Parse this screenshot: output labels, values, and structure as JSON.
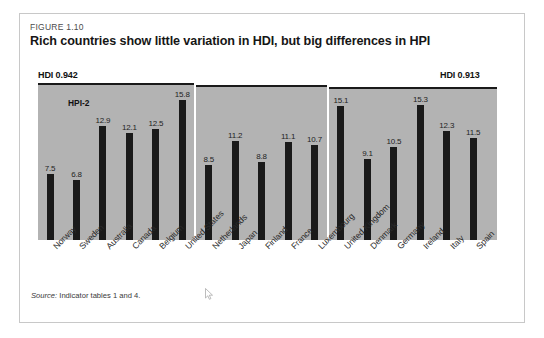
{
  "figure": {
    "number": "FIGURE 1.10",
    "title": "Rich countries show little variation in HDI, but big differences in HPI",
    "source_prefix": "Source:",
    "source_rest": " Indicator tables 1 and 4."
  },
  "annotations": {
    "hdi_left": "HDI 0.942",
    "hdi_right": "HDI 0.913",
    "series_label": "HPI-2"
  },
  "colors": {
    "plot_background": "#b3b3b3",
    "bar": "#1a1a1a",
    "frame": "#c8c8c8",
    "page": "#ffffff",
    "title_text": "#161616"
  },
  "chart_data": {
    "type": "bar",
    "title": "Rich countries show little variation in HDI, but big differences in HPI",
    "subtitle": "FIGURE 1.10",
    "xlabel": "",
    "ylabel": "",
    "ylim": [
      0,
      17.5
    ],
    "grid": false,
    "legend_position": "none",
    "series_name": "HPI-2",
    "categories": [
      "Norway",
      "Sweden",
      "Australia",
      "Canada",
      "Belgium",
      "United States",
      "Netherlands",
      "Japan",
      "Finland",
      "France",
      "Luxembourg",
      "United Kingdom",
      "Denmark",
      "Germany",
      "Ireland",
      "Italy",
      "Spain"
    ],
    "values": [
      7.5,
      6.8,
      12.9,
      12.1,
      12.5,
      15.8,
      8.5,
      11.2,
      8.8,
      11.1,
      10.7,
      15.1,
      9.1,
      10.5,
      15.3,
      12.3,
      11.5
    ],
    "annotations": [
      {
        "text": "HDI 0.942",
        "position": "top-left"
      },
      {
        "text": "HDI 0.913",
        "position": "top-right"
      },
      {
        "text": "HPI-2",
        "position": "series-callout"
      }
    ]
  }
}
